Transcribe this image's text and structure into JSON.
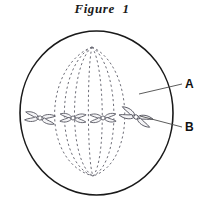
{
  "figure": {
    "title": "Figure  1",
    "colors": {
      "outline": "#1a1a1a",
      "spindle": "#6e6e78",
      "chromosome_stroke": "#55555f",
      "chromosome_fill": "#f4f4f6",
      "leader": "#4a4a4a",
      "label_text": "#111111",
      "background": "#ffffff"
    },
    "cell": {
      "name": "cell-membrane",
      "center_x": 96.5,
      "center_y": 113,
      "radius_x": 76.5,
      "radius_y": 82,
      "stroke_width": 1.6
    },
    "poles": {
      "top": {
        "x": 92,
        "y": 47
      },
      "bottom": {
        "x": 93,
        "y": 176
      }
    },
    "spindle_fibers": {
      "name": "spindle-fibers",
      "count": 7,
      "style": "dashed",
      "dash": "2.2 2.6",
      "bulge_offsets": [
        -48,
        -35,
        -22,
        -4,
        12,
        26,
        40
      ]
    },
    "chromosomes": [
      {
        "id": "chromosome-1",
        "x": 40,
        "y": 118,
        "rotation": 8,
        "length": 30,
        "label": ""
      },
      {
        "id": "chromosome-2",
        "x": 73,
        "y": 118,
        "rotation": 2,
        "length": 26,
        "label": ""
      },
      {
        "id": "chromosome-3",
        "x": 103,
        "y": 118,
        "rotation": -2,
        "length": 26,
        "label": ""
      },
      {
        "id": "chromosome-4",
        "x": 136,
        "y": 117,
        "rotation": 22,
        "length": 33,
        "label": ""
      }
    ],
    "callouts": [
      {
        "id": "callout-a",
        "label": "A",
        "refers_to": "spindle fiber",
        "line": {
          "x1": 139,
          "y1": 94,
          "x2": 182,
          "y2": 84
        }
      },
      {
        "id": "callout-b",
        "label": "B",
        "refers_to": "chromosome",
        "line": {
          "x1": 140,
          "y1": 116,
          "x2": 182,
          "y2": 127
        }
      }
    ]
  }
}
